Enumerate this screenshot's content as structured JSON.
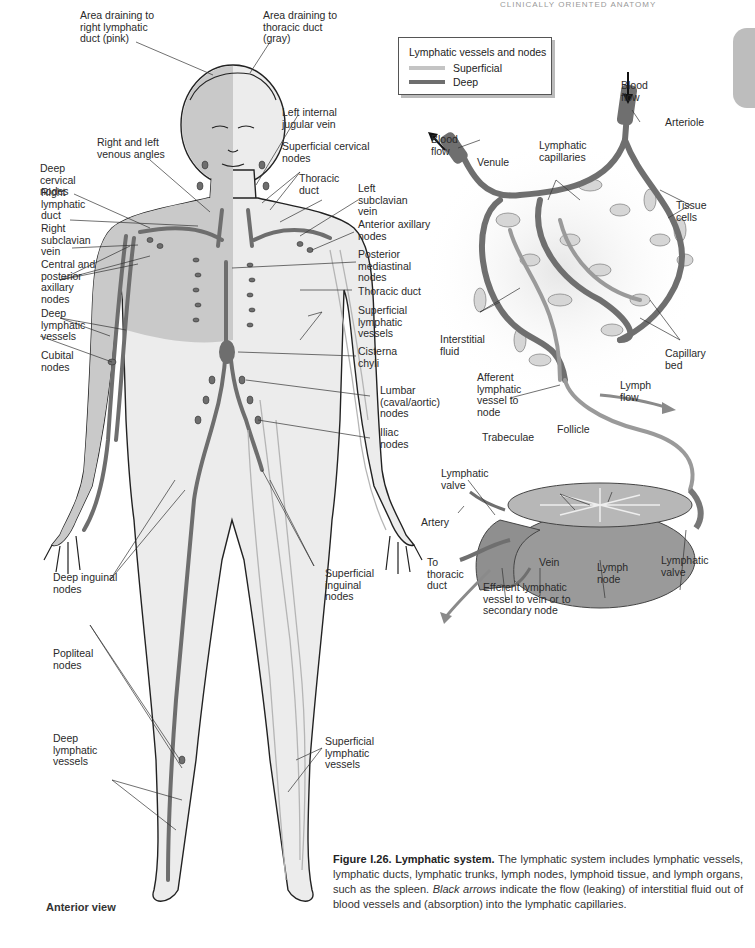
{
  "page": {
    "running_head": "CLINICALLY ORIENTED ANATOMY"
  },
  "legend": {
    "title": "Lymphatic vessels and nodes",
    "items": [
      {
        "label": "Superficial",
        "color": "#c4c4c4"
      },
      {
        "label": "Deep",
        "color": "#6e6e6e"
      }
    ]
  },
  "body_figure": {
    "view_label": "Anterior view",
    "colors": {
      "right_region": "#c9c9c9",
      "left_region": "#ececec",
      "deep_vessel": "#707070",
      "outline": "#222222"
    },
    "labels": {
      "area_right": "Area draining to\nright lymphatic\nduct (pink)",
      "area_left": "Area draining to\nthoracic duct\n(gray)",
      "left_internal_jugular": "Left internal\njugular vein",
      "venous_angles": "Right and left\nvenous angles",
      "superficial_cervical": "Superficial cervical\nnodes",
      "deep_cervical": "Deep\ncervical\nnodes",
      "thoracic_duct_upper": "Thoracic\nduct",
      "right_lymphatic_duct": "Right\nlymphatic\nduct",
      "left_subclavian": "Left\nsubclavian\nvein",
      "right_subclavian": "Right\nsubclavian\nvein",
      "anterior_axillary": "Anterior axillary\nnodes",
      "central_posterior_axillary": "Central and\nposterior\naxillary\nnodes",
      "posterior_mediastinal": "Posterior\nmediastinal\nnodes",
      "thoracic_duct_mid": "Thoracic duct",
      "deep_lymphatic_arm": "Deep\nlymphatic\nvessels",
      "superficial_lymphatic_arm": "Superficial\nlymphatic\nvessels",
      "cubital": "Cubital\nnodes",
      "cisterna_chyli": "Cisterna\nchyli",
      "lumbar": "Lumbar\n(caval/aortic)\nnodes",
      "iliac": "Iliac\nnodes",
      "deep_inguinal": "Deep inguinal\nnodes",
      "superficial_inguinal": "Superficial\ninguinal\nnodes",
      "popliteal": "Popliteal\nnodes",
      "deep_lymphatic_leg": "Deep\nlymphatic\nvessels",
      "superficial_lymphatic_leg": "Superficial\nlymphatic\nvessels"
    }
  },
  "detail_figure": {
    "labels": {
      "blood_flow_right": "Blood\nflow",
      "arteriole": "Arteriole",
      "blood_flow_left": "Blood\nflow",
      "venule": "Venule",
      "lymphatic_capillaries": "Lymphatic\ncapillaries",
      "tissue_cells": "Tissue\ncells",
      "interstitial_fluid": "Interstitial\nfluid",
      "capillary_bed": "Capillary\nbed",
      "afferent": "Afferent\nlymphatic\nvessel to\nnode",
      "lymph_flow": "Lymph\nflow",
      "follicle": "Follicle",
      "trabeculae": "Trabeculae",
      "lymphatic_valve_left": "Lymphatic\nvalve",
      "artery": "Artery",
      "to_thoracic_duct": "To\nthoracic\nduct",
      "vein": "Vein",
      "lymph_node": "Lymph\nnode",
      "lymphatic_valve_right": "Lymphatic\nvalve",
      "efferent": "Efferent lymphatic\nvessel to vein or to\nsecondary node"
    }
  },
  "caption": {
    "figure_number": "Figure I.26.",
    "figure_title": "Lymphatic system.",
    "text_before_italic": " The lymphatic system includes lymphatic vessels, lymphatic ducts, lymphatic trunks, lymph nodes, lymphoid tissue, and lymph organs, such as the spleen. ",
    "italic": "Black arrows",
    "text_after_italic": " indicate the flow (leaking) of interstitial fluid out of blood vessels and (absorption) into the lymphatic capillaries."
  }
}
